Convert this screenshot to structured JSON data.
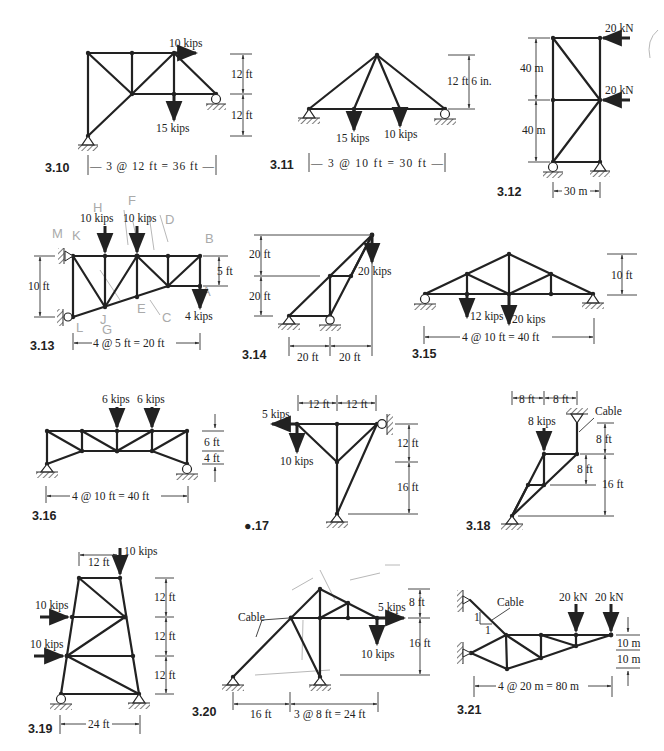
{
  "page": {
    "background": "#ffffff",
    "ink_color": "#222222",
    "pencil_color": "#b8b8b8"
  },
  "problems": [
    {
      "id": "3.10",
      "loads": [
        "10 kips",
        "15 kips"
      ],
      "dims": [
        "12 ft",
        "12 ft",
        "3 @ 12 ft = 36 ft"
      ]
    },
    {
      "id": "3.11",
      "loads": [
        "15 kips",
        "10 kips"
      ],
      "dims": [
        "12 ft 6 in.",
        "3 @ 10 ft = 30 ft"
      ]
    },
    {
      "id": "3.12",
      "loads": [
        "20 kN",
        "20 kN"
      ],
      "dims": [
        "40 m",
        "40 m",
        "30 m"
      ]
    },
    {
      "id": "3.13",
      "loads": [
        "10 kips",
        "10 kips",
        "4 kips"
      ],
      "dims": [
        "10 ft",
        "5 ft",
        "4 @ 5 ft = 20 ft"
      ],
      "pencil_marks": [
        "M",
        "K",
        "H",
        "F",
        "D",
        "B",
        "A",
        "G",
        "E",
        "C",
        "L",
        "J"
      ]
    },
    {
      "id": "3.14",
      "loads": [
        "20 kips"
      ],
      "dims": [
        "20 ft",
        "20 ft",
        "20 ft",
        "20 ft"
      ]
    },
    {
      "id": "3.15",
      "loads": [
        "12 kips",
        "20 kips"
      ],
      "dims": [
        "10 ft",
        "4 @ 10 ft = 40 ft"
      ]
    },
    {
      "id": "3.16",
      "loads": [
        "6 kips",
        "6 kips"
      ],
      "dims": [
        "6 ft",
        "4 ft",
        "4 @ 10 ft = 40 ft"
      ]
    },
    {
      "id": "3.17",
      "label_display": "●.17",
      "loads": [
        "5 kips",
        "10 kips"
      ],
      "dims": [
        "12 ft",
        "12 ft",
        "12 ft",
        "16 ft"
      ]
    },
    {
      "id": "3.18",
      "loads": [
        "8 kips"
      ],
      "dims": [
        "8 ft",
        "8 ft",
        "8 ft",
        "8 ft",
        "16 ft"
      ],
      "notes": [
        "Cable"
      ]
    },
    {
      "id": "3.19",
      "loads": [
        "10 kips",
        "10 kips",
        "10 kips"
      ],
      "dims": [
        "12 ft",
        "12 ft",
        "12 ft",
        "12 ft",
        "24 ft"
      ]
    },
    {
      "id": "3.20",
      "loads": [
        "5 kips",
        "10 kips"
      ],
      "dims": [
        "8 ft",
        "16 ft",
        "16 ft",
        "3 @ 8 ft = 24 ft"
      ],
      "notes": [
        "Cable"
      ]
    },
    {
      "id": "3.21",
      "loads": [
        "20 kN",
        "20 kN"
      ],
      "dims": [
        "10 m",
        "10 m",
        "4 @ 20 m = 80 m"
      ],
      "notes": [
        "Cable",
        "1",
        "1"
      ]
    }
  ],
  "labels": {
    "p310": {
      "num": "3.10",
      "l1": "10 kips",
      "l2": "15 kips",
      "d1": "12 ft",
      "d2": "12 ft",
      "span": "— 3 @ 12 ft = 36 ft —"
    },
    "p311": {
      "num": "3.11",
      "l1": "15 kips",
      "l2": "10 kips",
      "h": "12 ft 6 in.",
      "span": "— 3 @ 10 ft = 30 ft —"
    },
    "p312": {
      "num": "3.12",
      "l1": "20 kN",
      "l2": "20 kN",
      "d1": "40 m",
      "d2": "40 m",
      "span": "30 m"
    },
    "p313": {
      "num": "3.13",
      "l1": "10 kips",
      "l2": "10 kips",
      "l3": "4 kips",
      "h": "10 ft",
      "h2": "5 ft",
      "span": "4 @ 5 ft = 20 ft"
    },
    "p314": {
      "num": "3.14",
      "l1": "20 kips",
      "d1": "20 ft",
      "d2": "20 ft",
      "s1": "20 ft",
      "s2": "20 ft"
    },
    "p315": {
      "num": "3.15",
      "l1": "12 kips",
      "l2": "20 kips",
      "h": "10 ft",
      "span": "4 @ 10 ft = 40 ft"
    },
    "p316": {
      "num": "3.16",
      "l1": "6 kips",
      "l2": "6 kips",
      "d1": "6 ft",
      "d2": "4 ft",
      "span": "4 @ 10 ft = 40 ft"
    },
    "p317": {
      "num": "●.17",
      "l1": "5 kips",
      "l2": "10 kips",
      "s1": "12 ft",
      "s2": "12 ft",
      "d1": "12 ft",
      "d2": "16 ft"
    },
    "p318": {
      "num": "3.18",
      "l1": "8 kips",
      "s1": "8 ft",
      "s2": "8 ft",
      "d1": "8 ft",
      "d2": "8 ft",
      "d3": "16 ft",
      "cable": "Cable"
    },
    "p319": {
      "num": "3.19",
      "l1": "10 kips",
      "l2": "10 kips",
      "l3": "10 kips",
      "top": "12 ft",
      "d1": "12 ft",
      "d2": "12 ft",
      "d3": "12 ft",
      "span": "24 ft"
    },
    "p320": {
      "num": "3.20",
      "l1": "5 kips",
      "l2": "10 kips",
      "d1": "8 ft",
      "d2": "16 ft",
      "s1": "16 ft",
      "s2": "3 @ 8 ft = 24 ft",
      "cable": "Cable"
    },
    "p321": {
      "num": "3.21",
      "l1": "20 kN",
      "l2": "20 kN",
      "d1": "10 m",
      "d2": "10 m",
      "span": "4 @ 20 m = 80 m",
      "cable": "Cable",
      "slope_v": "1",
      "slope_h": "1"
    }
  },
  "pencil": {
    "m": "M",
    "k": "K",
    "h": "H",
    "f": "F",
    "d": "D",
    "b": "B",
    "a": "A",
    "l": "L",
    "j": "J",
    "g": "G",
    "e": "E",
    "c": "C"
  }
}
